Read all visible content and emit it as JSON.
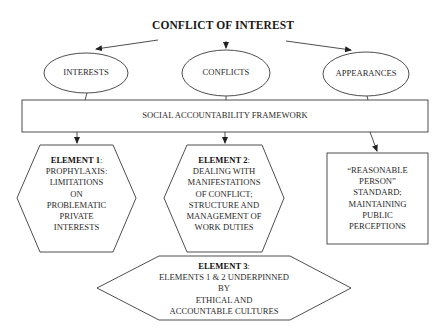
{
  "title": "CONFLICT OF INTEREST",
  "ellipses": [
    {
      "label": "INTERESTS"
    },
    {
      "label": "CONFLICTS"
    },
    {
      "label": "APPEARANCES"
    }
  ],
  "framework": {
    "label": "SOCIAL ACCOUNTABILITY FRAMEWORK"
  },
  "elements": [
    {
      "heading": "ELEMENT 1",
      "lines": [
        "PROPHYLAXIS:",
        "LIMITATIONS",
        "ON",
        "PROBLEMATIC",
        "PRIVATE",
        "INTERESTS"
      ]
    },
    {
      "heading": "ELEMENT 2",
      "lines": [
        "DEALING WITH",
        "MANIFESTATIONS",
        "OF CONFLICT;",
        "STRUCTURE AND",
        "MANAGEMENT OF",
        "WORK DUTIES"
      ]
    },
    {
      "lines": [
        "“REASONABLE",
        "PERSON”",
        "STANDARD;",
        "MAINTAINING",
        "PUBLIC",
        "PERCEPTIONS"
      ]
    },
    {
      "heading": "ELEMENT 3",
      "lines": [
        "ELEMENTS 1 & 2 UNDERPINNED",
        "BY",
        "ETHICAL AND",
        "ACCOUNTABLE CULTURES"
      ]
    }
  ],
  "colors": {
    "stroke": "#3a3a3a",
    "text": "#222222",
    "background": "#ffffff"
  }
}
